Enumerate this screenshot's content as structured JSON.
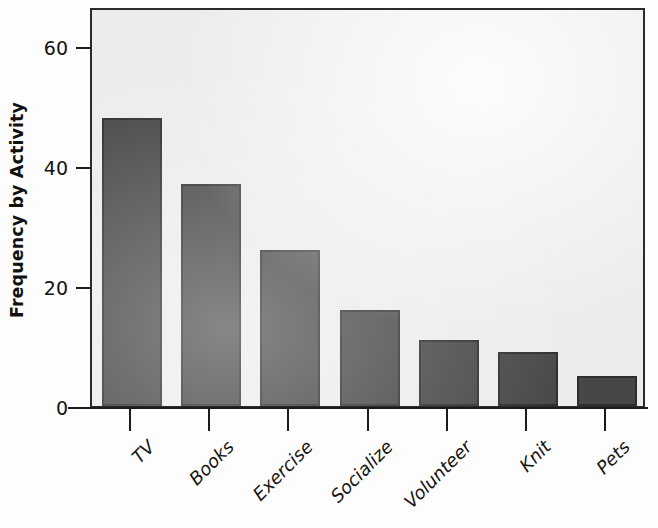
{
  "chart_data": {
    "type": "bar",
    "title": "",
    "subtitle": "",
    "xlabel": "",
    "ylabel": "Frequency by Activity",
    "categories": [
      "TV",
      "Books",
      "Exercise",
      "Socialize",
      "Volunteer",
      "Knit",
      "Pets"
    ],
    "values": [
      48,
      37,
      26,
      16,
      11,
      9,
      5
    ],
    "ylim": [
      0,
      65
    ],
    "xlim": [
      0,
      7
    ],
    "yticks": [
      0,
      20,
      40,
      60
    ],
    "ytick_labels": [
      "0",
      "20",
      "40",
      "60"
    ],
    "xtick_labels": [
      "TV",
      "Books",
      "Exercise",
      "Socialize",
      "Volunteer",
      "Knit",
      "Pets"
    ],
    "xtick_label_rotation": -45,
    "grid": false,
    "legend": false,
    "legend_position": "none",
    "bar_color": "#474747",
    "bar_edge_color": "#2e2e2e",
    "plot_background": "#ececec",
    "figure_background": "#fdfdfd",
    "axis_color": "#1c1c1c",
    "text_color": "#141414"
  },
  "axes": {
    "y_title": "Frequency by Activity",
    "y_ticks": [
      {
        "label": "60",
        "value": 60
      },
      {
        "label": "40",
        "value": 40
      },
      {
        "label": "20",
        "value": 20
      },
      {
        "label": "0",
        "value": 0
      }
    ]
  },
  "bars": [
    {
      "label": "TV",
      "value": 48
    },
    {
      "label": "Books",
      "value": 37
    },
    {
      "label": "Exercise",
      "value": 26
    },
    {
      "label": "Socialize",
      "value": 16
    },
    {
      "label": "Volunteer",
      "value": 11
    },
    {
      "label": "Knit",
      "value": 9
    },
    {
      "label": "Pets",
      "value": 5
    }
  ]
}
